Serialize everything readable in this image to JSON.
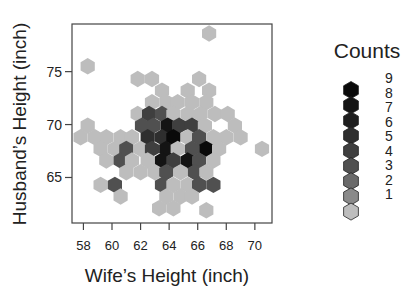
{
  "chart_data": {
    "type": "heatmap",
    "subtype": "hexbin",
    "title": "",
    "xlabel": "Wife’s Height (inch)",
    "ylabel": "Husband’s Height (inch)",
    "xlim": [
      57.2,
      71.2
    ],
    "ylim": [
      60.7,
      79.5
    ],
    "x_ticks": [
      58,
      60,
      62,
      64,
      66,
      68,
      70
    ],
    "y_ticks": [
      65,
      70,
      75
    ],
    "grid": false,
    "legend": {
      "title": "Counts",
      "position": "right",
      "levels": [
        9,
        8,
        7,
        6,
        5,
        4,
        3,
        2,
        1
      ],
      "colors": [
        "#0a0a0a",
        "#141414",
        "#1e1e1e",
        "#2e2e2e",
        "#3f3f3f",
        "#505050",
        "#6a6a6a",
        "#8a8a8a",
        "#bdbdbd"
      ]
    },
    "hex_rows": [
      {
        "y": 78.6,
        "cells": [
          [
            66.8,
            1
          ]
        ]
      },
      {
        "y": 75.5,
        "cells": [
          [
            58.3,
            1
          ]
        ]
      },
      {
        "y": 74.3,
        "cells": [
          [
            61.8,
            1
          ],
          [
            62.8,
            1
          ],
          [
            66.1,
            1
          ]
        ]
      },
      {
        "y": 73.2,
        "cells": [
          [
            63.5,
            1
          ],
          [
            65.3,
            1
          ],
          [
            66.8,
            1
          ]
        ]
      },
      {
        "y": 72.1,
        "cells": [
          [
            62.8,
            1
          ],
          [
            63.8,
            1
          ],
          [
            64.6,
            1
          ],
          [
            65.6,
            1
          ],
          [
            66.6,
            1
          ]
        ]
      },
      {
        "y": 71.0,
        "cells": [
          [
            61.8,
            1
          ],
          [
            62.6,
            5
          ],
          [
            63.5,
            4
          ],
          [
            64.3,
            1
          ],
          [
            65.3,
            1
          ],
          [
            66.2,
            1
          ],
          [
            67.2,
            1
          ],
          [
            68.1,
            1
          ]
        ]
      },
      {
        "y": 69.9,
        "cells": [
          [
            58.3,
            1
          ],
          [
            62.1,
            4
          ],
          [
            62.9,
            4
          ],
          [
            63.9,
            8
          ],
          [
            64.7,
            5
          ],
          [
            65.6,
            5
          ],
          [
            66.5,
            1
          ],
          [
            68.6,
            1
          ]
        ]
      },
      {
        "y": 68.8,
        "cells": [
          [
            57.8,
            1
          ],
          [
            58.8,
            1
          ],
          [
            59.6,
            1
          ],
          [
            60.6,
            1
          ],
          [
            61.4,
            1
          ],
          [
            62.5,
            6
          ],
          [
            63.5,
            6
          ],
          [
            64.3,
            9
          ],
          [
            65.3,
            1
          ],
          [
            66.1,
            4
          ],
          [
            67.1,
            1
          ],
          [
            68.0,
            1
          ],
          [
            69.0,
            1
          ]
        ]
      },
      {
        "y": 67.7,
        "cells": [
          [
            59.2,
            1
          ],
          [
            60.2,
            1
          ],
          [
            61.0,
            4
          ],
          [
            62.0,
            1
          ],
          [
            62.8,
            5
          ],
          [
            63.8,
            8
          ],
          [
            64.6,
            1
          ],
          [
            65.6,
            4
          ],
          [
            66.6,
            9
          ],
          [
            67.5,
            1
          ],
          [
            70.5,
            1
          ]
        ]
      },
      {
        "y": 66.6,
        "cells": [
          [
            59.6,
            1
          ],
          [
            60.6,
            4
          ],
          [
            61.4,
            1
          ],
          [
            62.5,
            1
          ],
          [
            63.5,
            8
          ],
          [
            64.3,
            5
          ],
          [
            65.3,
            8
          ],
          [
            66.1,
            4
          ],
          [
            67.1,
            1
          ]
        ]
      },
      {
        "y": 65.5,
        "cells": [
          [
            61.0,
            1
          ],
          [
            62.0,
            1
          ],
          [
            63.0,
            1
          ],
          [
            63.8,
            4
          ],
          [
            64.8,
            1
          ],
          [
            65.8,
            4
          ],
          [
            66.6,
            1
          ]
        ]
      },
      {
        "y": 64.3,
        "cells": [
          [
            59.2,
            1
          ],
          [
            60.2,
            4
          ],
          [
            63.5,
            4
          ],
          [
            64.3,
            1
          ],
          [
            65.3,
            1
          ],
          [
            66.1,
            4
          ],
          [
            67.1,
            4
          ]
        ]
      },
      {
        "y": 63.2,
        "cells": [
          [
            60.6,
            1
          ],
          [
            63.8,
            1
          ],
          [
            64.8,
            1
          ],
          [
            65.6,
            1
          ]
        ]
      },
      {
        "y": 62.1,
        "cells": [
          [
            63.3,
            1
          ],
          [
            64.3,
            1
          ]
        ]
      },
      {
        "y": 61.9,
        "cells": [
          [
            66.6,
            1
          ]
        ]
      }
    ]
  }
}
